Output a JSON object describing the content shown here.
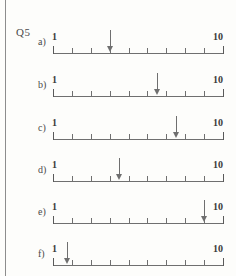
{
  "page": {
    "question_label": "Q5",
    "spine_color": "#8d8d8d",
    "background": "#fdfdfb",
    "ink_color": "#6f6f6f"
  },
  "number_line": {
    "start_value": "1",
    "end_value": "10",
    "tick_count": 10,
    "left_label": "1",
    "right_label": "10"
  },
  "rows": [
    {
      "letter": "a)",
      "left_label": "1",
      "right_label": "10",
      "arrow_value": 4.0,
      "arrow_height": 22,
      "top": 18
    },
    {
      "letter": "b)",
      "left_label": "1",
      "right_label": "10",
      "arrow_value": 6.5,
      "arrow_height": 22,
      "top": 61
    },
    {
      "letter": "c)",
      "left_label": "1",
      "right_label": "10",
      "arrow_value": 7.5,
      "arrow_height": 22,
      "top": 104
    },
    {
      "letter": "d)",
      "left_label": "1",
      "right_label": "10",
      "arrow_value": 4.5,
      "arrow_height": 22,
      "top": 146
    },
    {
      "letter": "e)",
      "left_label": "1",
      "right_label": "10",
      "arrow_value": 9.0,
      "arrow_height": 22,
      "top": 188
    },
    {
      "letter": "f)",
      "left_label": "1",
      "right_label": "10",
      "arrow_value": 1.75,
      "arrow_height": 22,
      "top": 230
    }
  ]
}
